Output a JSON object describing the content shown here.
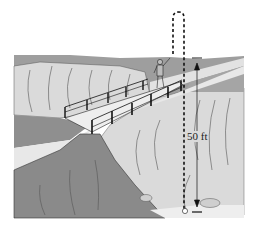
{
  "figure": {
    "height_label": "50 ft",
    "colors": {
      "background": "#ffffff",
      "far_ridge": "#9a9a9a",
      "cliff_face": "#d9d9d9",
      "river": "#e4e4e4",
      "near_rock": "#8a8a8a",
      "riverbank_dark": "#a3a3a3",
      "line": "#1a1a1a",
      "crack": "#6a6a6a"
    }
  }
}
